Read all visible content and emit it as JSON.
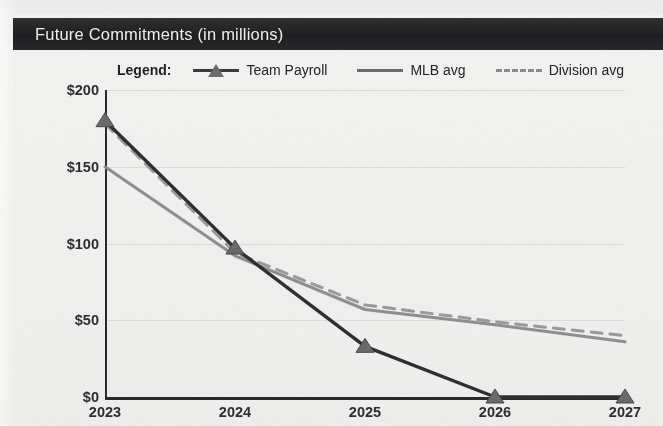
{
  "header": {
    "title": "Future Commitments (in millions)",
    "bar_color": "#242426",
    "text_color": "#f0f0ee"
  },
  "legend": {
    "title": "Legend:",
    "position": "top",
    "items": [
      {
        "label": "Team Payroll",
        "marker": "triangle-marker-icon",
        "style": "solid",
        "color": "#2f2f31"
      },
      {
        "label": "MLB avg",
        "marker": "line-marker-icon",
        "style": "solid",
        "color": "#8f8f8f"
      },
      {
        "label": "Division avg",
        "marker": "dashed-line-marker-icon",
        "style": "dashed",
        "color": "#9a9a9a"
      }
    ]
  },
  "chart_data": {
    "type": "line",
    "title": "Future Commitments (in millions)",
    "xlabel": "",
    "ylabel": "",
    "x": [
      "2023",
      "2024",
      "2025",
      "2026",
      "2027"
    ],
    "categories": [
      "2023",
      "2024",
      "2025",
      "2026",
      "2027"
    ],
    "ylim": [
      0,
      200
    ],
    "yticks": [
      0,
      50,
      100,
      150,
      200
    ],
    "ytick_labels": [
      "$0",
      "$50",
      "$100",
      "$150",
      "$200"
    ],
    "xtick_labels": [
      "2023",
      "2024",
      "2025",
      "2026",
      "2027"
    ],
    "grid": true,
    "grid_axis": "y",
    "legend_position": "top",
    "series": [
      {
        "name": "Team Payroll",
        "style": "solid",
        "marker": "triangle",
        "color": "#2f2f31",
        "values": [
          180,
          97,
          33,
          0,
          0
        ]
      },
      {
        "name": "MLB avg",
        "style": "solid",
        "marker": "none",
        "color": "#8f8f8f",
        "values": [
          150,
          92,
          57,
          47,
          36
        ]
      },
      {
        "name": "Division avg",
        "style": "dashed",
        "marker": "none",
        "color": "#9a9a9a",
        "values": [
          178,
          94,
          60,
          49,
          40
        ]
      }
    ]
  },
  "axis": {
    "y_labels": [
      "$200",
      "$150",
      "$100",
      "$50",
      "$0"
    ],
    "x_labels": [
      "2023",
      "2024",
      "2025",
      "2026",
      "2027"
    ]
  },
  "colors": {
    "background": "#f1f1ef",
    "panel": "#f3f3f1",
    "axis": "#2b2b2d",
    "gridline": "#dcdcda",
    "payroll": "#2f2f31",
    "mlb_avg": "#8f8f8f",
    "division_avg": "#9a9a9a"
  }
}
